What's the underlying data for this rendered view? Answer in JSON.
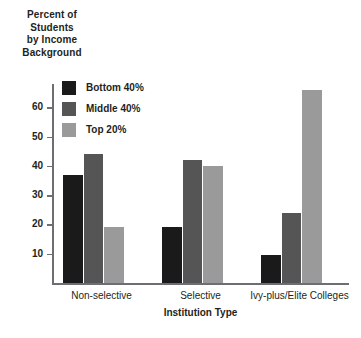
{
  "chart_data": {
    "type": "bar",
    "title": "",
    "xlabel": "Institution Type",
    "ylabel": "Percent of Students by Income Background",
    "ylabel_lines": [
      "Percent of",
      "Students",
      "by Income",
      "Background"
    ],
    "categories": [
      "Non-selective",
      "Selective",
      "Ivy-plus/Elite Colleges"
    ],
    "series": [
      {
        "name": "Bottom 40%",
        "color": "#1a1a1a",
        "values": [
          37,
          19,
          9.5
        ]
      },
      {
        "name": "Middle 40%",
        "color": "#555555",
        "values": [
          44,
          42,
          24
        ]
      },
      {
        "name": "Top 20%",
        "color": "#9a9a9a",
        "values": [
          19,
          40,
          66
        ]
      }
    ],
    "ylim": [
      0,
      68
    ],
    "yticks": [
      60,
      50,
      40,
      30,
      20,
      10
    ],
    "ytick_labels": [
      "60",
      "50",
      "40",
      "30",
      "20",
      "10"
    ],
    "grid": false,
    "legend_position": "upper-left-inside",
    "axis_color": "#6d6e71"
  },
  "legend": {
    "entries": [
      {
        "label": "Bottom 40%",
        "swatch": "#1a1a1a"
      },
      {
        "label": "Middle 40%",
        "swatch": "#555555"
      },
      {
        "label": "Top 20%",
        "swatch": "#9a9a9a"
      }
    ]
  }
}
